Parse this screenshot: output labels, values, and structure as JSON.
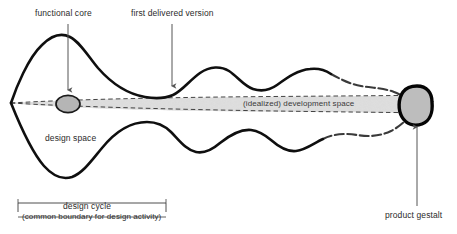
{
  "diagram": {
    "labels": {
      "functional_core": "functional core",
      "first_delivered_version": "first delivered version",
      "development_space": "(idealized) development space",
      "design_space": "design space",
      "product_gestalt": "product gestalt",
      "design_cycle": "design cycle",
      "common_boundary": "(common boundary for design activity)"
    },
    "colors": {
      "background": "#ffffff",
      "curve_stroke": "#111111",
      "dashed_stroke": "#333333",
      "speckle_fill": "#d9d9d9",
      "shape_fill": "#b3b3b3",
      "shape_outline": "#000000",
      "text": "#2b2b2b",
      "arrow": "#555555"
    },
    "shapes": {
      "functional_core_ellipse": {
        "name": "functional-core-ellipse",
        "cx": 68,
        "cy": 104,
        "rx": 12,
        "ry": 8.5
      },
      "product_gestalt_blob": {
        "name": "product-gestalt-blob",
        "cx": 417,
        "cy": 104,
        "rx": 14,
        "ry": 18
      }
    },
    "arrows": [
      {
        "name": "arrow-functional-core",
        "x1": 68,
        "y1": 25,
        "x2": 68,
        "y2": 92
      },
      {
        "name": "arrow-first-delivered-version",
        "x1": 172,
        "y1": 25,
        "x2": 172,
        "y2": 88
      },
      {
        "name": "arrow-product-gestalt",
        "x1": 417,
        "y1": 205,
        "x2": 417,
        "y2": 128
      }
    ],
    "bracket": {
      "name": "design-cycle-bracket",
      "x_start": 18,
      "x_end": 166,
      "y": 207
    }
  }
}
